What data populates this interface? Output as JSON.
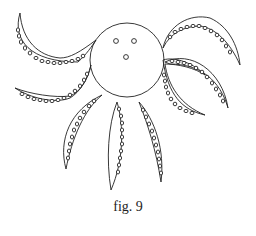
{
  "figure": {
    "parts": [
      "body-circle",
      "eyes",
      "mouth",
      "tentacles"
    ],
    "tentacle_count": 7,
    "stroke_color": "#222222",
    "background": "#ffffff"
  },
  "caption": {
    "text": "fig. 9"
  }
}
